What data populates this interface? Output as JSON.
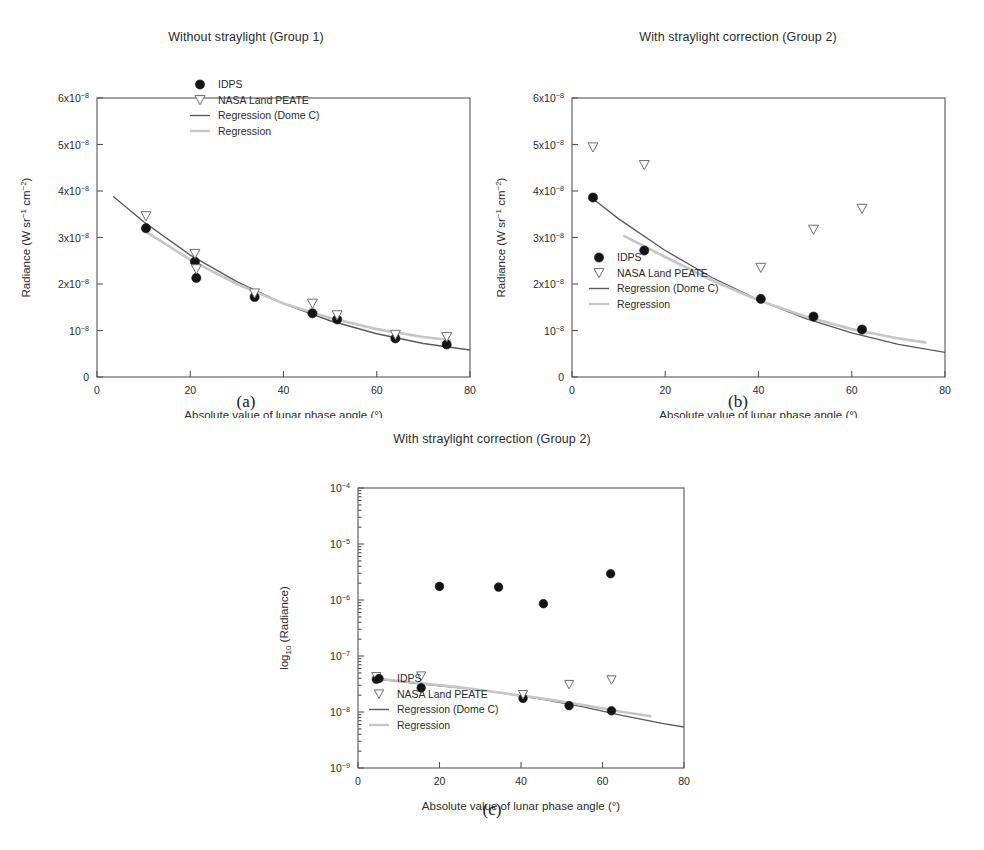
{
  "figure": {
    "panels": [
      {
        "id": "a",
        "caption": "(a)",
        "title": "Without straylight (Group 1)",
        "xlabel": "Absolute value of lunar phase angle (°)",
        "ylabel_main": "Radiance (W sr",
        "ylabel_sup1": "-1",
        "ylabel_mid": " cm",
        "ylabel_sup2": "-2",
        "ylabel_end": ")",
        "legend_position": "top-right"
      },
      {
        "id": "b",
        "caption": "(b)",
        "title": "With straylight correction (Group 2)",
        "xlabel": "Absolute value of lunar phase angle (°)",
        "ylabel_main": "Radiance (W sr",
        "ylabel_sup1": "-1",
        "ylabel_mid": " cm",
        "ylabel_sup2": "-2",
        "ylabel_end": ")",
        "legend_position": "bottom-left"
      },
      {
        "id": "c",
        "caption": "(c)",
        "title": "With straylight correction (Group 2)",
        "xlabel": "Absolute value of lunar phase angle (°)",
        "ylabel_main": "log",
        "ylabel_sub": "10",
        "ylabel_end": " (Radiance)",
        "legend_position": "bottom-left"
      }
    ],
    "legend_entries": [
      {
        "key": "idps",
        "label": "IDPS",
        "marker": "filled-circle",
        "color": "#141414"
      },
      {
        "key": "nasa",
        "label": "NASA Land PEATE",
        "marker": "open-down-triangle",
        "color": "#6e6e72"
      },
      {
        "key": "dome",
        "label": "Regression (Dome C)",
        "marker": "line",
        "color": "#5a5a5e"
      },
      {
        "key": "reg",
        "label": "Regression",
        "marker": "line",
        "color": "#c6c6c8"
      }
    ]
  },
  "chart_data": [
    {
      "id": "a",
      "type": "scatter",
      "title": "Without straylight (Group 1)",
      "xlabel": "Absolute value of lunar phase angle (°)",
      "ylabel": "Radiance (W sr-1 cm-2)",
      "xlim": [
        0,
        80
      ],
      "ylim": [
        0,
        6e-08
      ],
      "xticks": [
        0,
        20,
        40,
        60,
        80
      ],
      "xtick_labels": [
        "0",
        "20",
        "40",
        "60",
        "80"
      ],
      "yticks": [
        0,
        1e-08,
        2e-08,
        3e-08,
        4e-08,
        5e-08,
        6e-08
      ],
      "ytick_labels": [
        "0",
        "10-8",
        "2x10-8",
        "3x10-8",
        "4x10-8",
        "5x10-8",
        "6x10-8"
      ],
      "yscale": "linear",
      "grid": false,
      "legend_position": "upper right",
      "series": [
        {
          "name": "IDPS",
          "marker": "filled-circle",
          "x": [
            10.5,
            21.0,
            21.3,
            33.8,
            46.2,
            51.5,
            64.0,
            75.0
          ],
          "y": [
            3.2e-08,
            2.48e-08,
            2.13e-08,
            1.72e-08,
            1.37e-08,
            1.24e-08,
            8.3e-09,
            7e-09
          ]
        },
        {
          "name": "NASA Land PEATE",
          "marker": "open-down-triangle",
          "x": [
            10.5,
            21.0,
            21.3,
            33.8,
            46.2,
            51.5,
            64.0,
            75.0
          ],
          "y": [
            3.46e-08,
            2.65e-08,
            2.32e-08,
            1.8e-08,
            1.58e-08,
            1.33e-08,
            9.1e-09,
            8.6e-09
          ]
        },
        {
          "name": "Regression (Dome C)",
          "marker": "line",
          "x": [
            3.5,
            10,
            20,
            30,
            40,
            50,
            60,
            70,
            80
          ],
          "y": [
            3.88e-08,
            3.34e-08,
            2.62e-08,
            2.05e-08,
            1.58e-08,
            1.21e-08,
            9.3e-09,
            7.2e-09,
            5.8e-09
          ]
        },
        {
          "name": "Regression",
          "marker": "line",
          "x": [
            10,
            20,
            30,
            40,
            50,
            60,
            70,
            76
          ],
          "y": [
            3.16e-08,
            2.52e-08,
            2e-08,
            1.58e-08,
            1.27e-08,
            1.03e-08,
            8.6e-09,
            7.9e-09
          ]
        }
      ]
    },
    {
      "id": "b",
      "type": "scatter",
      "title": "With straylight correction (Group 2)",
      "xlabel": "Absolute value of lunar phase angle (°)",
      "ylabel": "Radiance (W sr-1 cm-2)",
      "xlim": [
        0,
        80
      ],
      "ylim": [
        0,
        6e-08
      ],
      "xticks": [
        0,
        20,
        40,
        60,
        80
      ],
      "xtick_labels": [
        "0",
        "20",
        "40",
        "60",
        "80"
      ],
      "yticks": [
        0,
        1e-08,
        2e-08,
        3e-08,
        4e-08,
        5e-08,
        6e-08
      ],
      "ytick_labels": [
        "0",
        "10-8",
        "2x10-8",
        "3x10-8",
        "4x10-8",
        "5x10-8",
        "6x10-8"
      ],
      "yscale": "linear",
      "grid": false,
      "legend_position": "lower left",
      "series": [
        {
          "name": "IDPS",
          "marker": "filled-circle",
          "x": [
            4.5,
            15.5,
            40.5,
            51.8,
            62.2
          ],
          "y": [
            3.86e-08,
            2.72e-08,
            1.68e-08,
            1.3e-08,
            1.02e-08
          ]
        },
        {
          "name": "NASA Land PEATE",
          "marker": "open-down-triangle",
          "x": [
            4.5,
            15.5,
            40.5,
            51.8,
            62.2
          ],
          "y": [
            4.94e-08,
            4.56e-08,
            2.35e-08,
            3.17e-08,
            3.62e-08
          ]
        },
        {
          "name": "Regression (Dome C)",
          "marker": "line",
          "x": [
            4.0,
            10,
            20,
            30,
            40,
            50,
            60,
            70,
            80
          ],
          "y": [
            3.87e-08,
            3.4e-08,
            2.72e-08,
            2.14e-08,
            1.66e-08,
            1.26e-08,
            9.5e-09,
            7e-09,
            5.3e-09
          ]
        },
        {
          "name": "Regression",
          "marker": "line",
          "x": [
            11,
            20,
            30,
            40,
            50,
            60,
            70,
            76
          ],
          "y": [
            3.04e-08,
            2.58e-08,
            2.08e-08,
            1.65e-08,
            1.3e-08,
            1.03e-08,
            8.3e-09,
            7.4e-09
          ]
        }
      ]
    },
    {
      "id": "c",
      "type": "scatter",
      "title": "With straylight correction (Group 2)",
      "xlabel": "Absolute value of lunar phase angle (°)",
      "ylabel": "log10 (Radiance)",
      "xlim": [
        0,
        80
      ],
      "ylim": [
        1e-09,
        0.0001
      ],
      "xticks": [
        0,
        20,
        40,
        60,
        80
      ],
      "xtick_labels": [
        "0",
        "20",
        "40",
        "60",
        "80"
      ],
      "yticks": [
        1e-09,
        1e-08,
        1e-07,
        1e-06,
        1e-05,
        0.0001
      ],
      "ytick_labels": [
        "10-9",
        "10-8",
        "10-7",
        "10-6",
        "10-5",
        "10-4"
      ],
      "yscale": "log",
      "grid": false,
      "legend_position": "lower left",
      "series": [
        {
          "name": "IDPS",
          "marker": "filled-circle",
          "x": [
            4.5,
            15.5,
            20.0,
            34.5,
            40.5,
            45.5,
            51.8,
            62.0,
            62.2
          ],
          "y": [
            3.85e-08,
            2.7e-08,
            1.75e-06,
            1.7e-06,
            1.75e-08,
            8.6e-07,
            1.3e-08,
            2.95e-06,
            1.05e-08
          ]
        },
        {
          "name": "NASA Land PEATE",
          "marker": "open-down-triangle",
          "x": [
            4.5,
            15.5,
            40.5,
            51.8,
            62.2
          ],
          "y": [
            4.3e-08,
            4.4e-08,
            2.05e-08,
            3.1e-08,
            3.75e-08
          ]
        },
        {
          "name": "Regression (Dome C)",
          "marker": "line",
          "x": [
            4.0,
            15,
            25,
            35,
            45,
            55,
            65,
            75,
            80
          ],
          "y": [
            3.9e-08,
            3.2e-08,
            2.7e-08,
            2.2e-08,
            1.7e-08,
            1.25e-08,
            8.6e-09,
            6.2e-09,
            5.4e-09
          ]
        },
        {
          "name": "Regression",
          "marker": "line",
          "x": [
            4.0,
            15,
            25,
            35,
            45,
            55,
            65,
            72
          ],
          "y": [
            4e-08,
            3.3e-08,
            2.75e-08,
            2.2e-08,
            1.75e-08,
            1.35e-08,
            1e-08,
            8.4e-09
          ]
        }
      ]
    }
  ]
}
